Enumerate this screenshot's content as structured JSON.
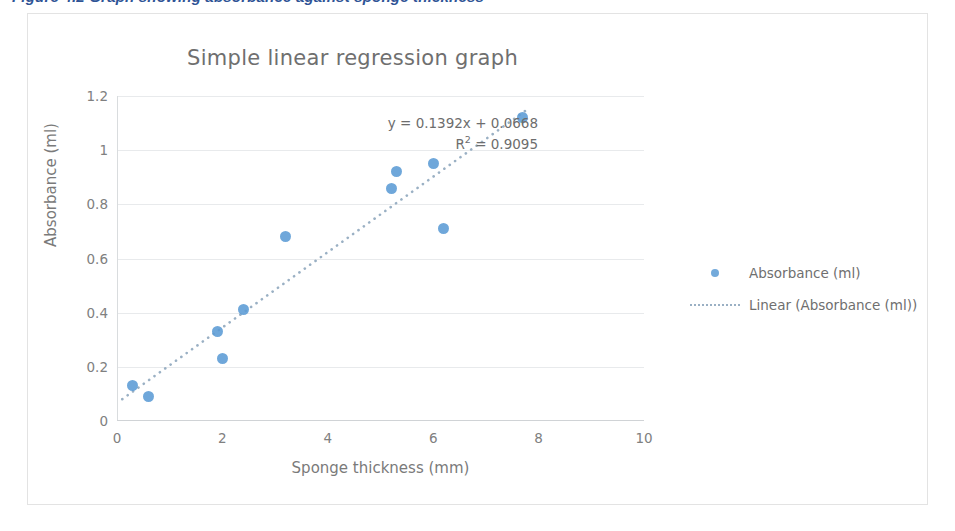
{
  "page": {
    "clipped_heading": "Figure 4.2  Graph showing absorbance against sponge thickness"
  },
  "chart": {
    "title": "Simple linear regression graph",
    "equation_line1": "y = 0.1392x  + 0.0668",
    "equation_line2_prefix": "R",
    "equation_line2_sup": "2",
    "equation_line2_suffix": " = 0.9095",
    "x_axis_title": "Sponge thickness (mm)",
    "y_axis_title": "Absorbance (ml)",
    "legend": [
      {
        "key": "series-marker",
        "label": "Absorbance (ml)"
      },
      {
        "key": "trendline-marker",
        "label": "Linear (Absorbance (ml))"
      }
    ],
    "colors": {
      "marker": "#5b9bd5",
      "trendline": "#9ab0c4",
      "gridline": "#e8eaec",
      "text": "#7a7a7a",
      "frame_border": "#e3e3e3",
      "heading": "#2f5496"
    }
  },
  "chart_data": {
    "type": "scatter",
    "title": "Simple linear regression graph",
    "xlabel": "Sponge thickness (mm)",
    "ylabel": "Absorbance (ml)",
    "xlim": [
      0,
      10
    ],
    "ylim": [
      0,
      1.2
    ],
    "xticks": [
      0,
      2,
      4,
      6,
      8,
      10
    ],
    "yticks": [
      0,
      0.2,
      0.4,
      0.6,
      0.8,
      1,
      1.2
    ],
    "xtick_labels": [
      "0",
      "2",
      "4",
      "6",
      "8",
      "10"
    ],
    "ytick_labels": [
      "0",
      "0.2",
      "0.4",
      "0.6",
      "0.8",
      "1",
      "1.2"
    ],
    "grid": "horizontal",
    "legend_position": "right",
    "series": [
      {
        "name": "Absorbance (ml)",
        "type": "scatter",
        "color": "#5b9bd5",
        "points": [
          {
            "x": 0.3,
            "y": 0.13
          },
          {
            "x": 0.6,
            "y": 0.09
          },
          {
            "x": 1.9,
            "y": 0.33
          },
          {
            "x": 2.0,
            "y": 0.23
          },
          {
            "x": 2.4,
            "y": 0.41
          },
          {
            "x": 3.2,
            "y": 0.68
          },
          {
            "x": 5.2,
            "y": 0.86
          },
          {
            "x": 5.3,
            "y": 0.92
          },
          {
            "x": 6.0,
            "y": 0.95
          },
          {
            "x": 6.2,
            "y": 0.71
          },
          {
            "x": 7.7,
            "y": 1.12
          }
        ]
      },
      {
        "name": "Linear (Absorbance (ml))",
        "type": "line",
        "style": "dotted",
        "color": "#9ab0c4",
        "slope": 0.1392,
        "intercept": 0.0668,
        "r_squared": 0.9095,
        "x_range": [
          0.1,
          7.75
        ]
      }
    ],
    "annotations": [
      {
        "text": "y = 0.1392x  + 0.0668",
        "x": 4.0,
        "y": 1.08
      },
      {
        "text": "R² = 0.9095",
        "x": 4.0,
        "y": 1.01
      }
    ]
  }
}
